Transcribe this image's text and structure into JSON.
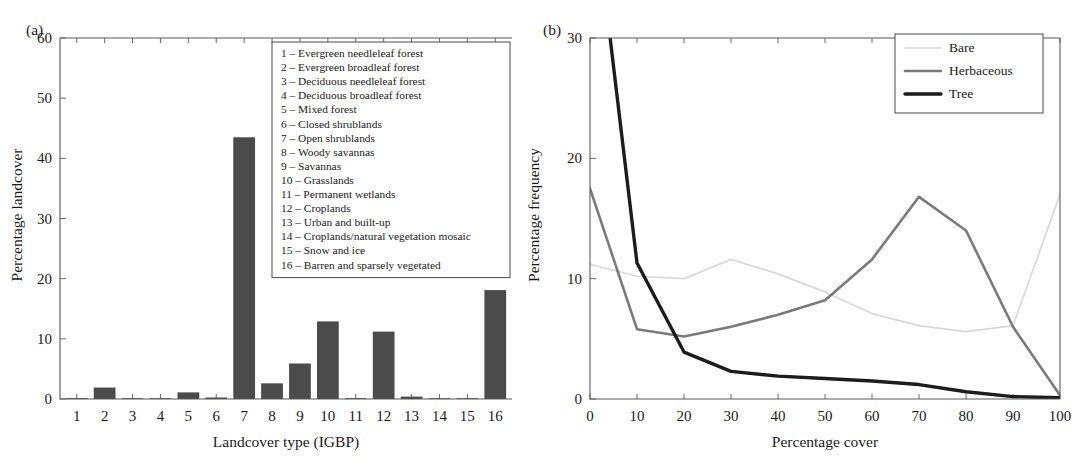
{
  "figure": {
    "panel_a_label": "(a)",
    "panel_b_label": "(b)"
  },
  "chart_data": [
    {
      "type": "bar",
      "panel": "(a)",
      "title": "",
      "xlabel": "Landcover type (IGBP)",
      "ylabel": "Percentage landcover",
      "categories": [
        "1",
        "2",
        "3",
        "4",
        "5",
        "6",
        "7",
        "8",
        "9",
        "10",
        "11",
        "12",
        "13",
        "14",
        "15",
        "16"
      ],
      "values": [
        0.15,
        1.9,
        0.05,
        0.05,
        1.1,
        0.25,
        43.5,
        2.6,
        5.9,
        12.9,
        0.15,
        11.2,
        0.4,
        0.1,
        0.1,
        18.1
      ],
      "xlim": [
        0.4,
        16.6
      ],
      "ylim": [
        0,
        60
      ],
      "yticks": [
        0,
        10,
        20,
        30,
        40,
        50,
        60
      ],
      "xticks": [
        "1",
        "2",
        "3",
        "4",
        "5",
        "6",
        "7",
        "8",
        "9",
        "10",
        "11",
        "12",
        "13",
        "14",
        "15",
        "16"
      ],
      "bar_color": "#4b4b4b",
      "grid": false,
      "legend_position": "upper-center",
      "legend_entries": [
        "1 – Evergreen needleleaf forest",
        "2 – Evergreen broadleaf forest",
        "3 – Deciduous needleleaf forest",
        "4 – Deciduous broadleaf forest",
        "5 – Mixed forest",
        "6 – Closed shrublands",
        "7 – Open shrublands",
        "8 – Woody savannas",
        "9 – Savannas",
        "10 – Grasslands",
        "11 – Permanent wetlands",
        "12 – Croplands",
        "13 – Urban and built-up",
        "14 – Croplands/natural vegetation mosaic",
        "15 – Snow and ice",
        "16 – Barren and sparsely vegetated"
      ]
    },
    {
      "type": "line",
      "panel": "(b)",
      "title": "",
      "xlabel": "Percentage cover",
      "ylabel": "Percentage frequency",
      "x": [
        0,
        10,
        20,
        30,
        40,
        50,
        60,
        70,
        80,
        90,
        100
      ],
      "xlim": [
        0,
        100
      ],
      "ylim": [
        0,
        30
      ],
      "yticks": [
        0,
        10,
        20,
        30
      ],
      "xticks": [
        0,
        10,
        20,
        30,
        40,
        50,
        60,
        70,
        80,
        90,
        100
      ],
      "grid": false,
      "legend_position": "upper-right",
      "series": [
        {
          "name": "Bare",
          "color": "#d8d8d8",
          "width": 1.7,
          "values": [
            11.2,
            10.2,
            10.0,
            11.6,
            10.4,
            8.9,
            7.1,
            6.1,
            5.6,
            6.1,
            17.0
          ]
        },
        {
          "name": "Herbaceous",
          "color": "#7a7a7a",
          "width": 2.6,
          "values": [
            17.5,
            5.8,
            5.2,
            6.0,
            7.0,
            8.2,
            11.6,
            16.8,
            14.0,
            6.0,
            0.3
          ]
        },
        {
          "name": "Tree",
          "color": "#1c1c1c",
          "width": 3.4,
          "values": [
            44.0,
            11.3,
            3.9,
            2.3,
            1.9,
            1.7,
            1.5,
            1.2,
            0.6,
            0.2,
            0.1
          ]
        }
      ]
    }
  ]
}
